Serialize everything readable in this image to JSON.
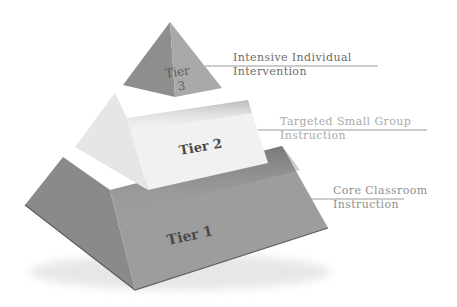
{
  "diagram": {
    "type": "pyramid",
    "tiers": [
      {
        "id": "tier-3",
        "shape_label_line1": "Tier",
        "shape_label_line2": "3",
        "description_line1": "Intensive Individual",
        "description_line2": "Intervention",
        "text_color": "#6b6b6b",
        "rule_color": "#9a9a9a"
      },
      {
        "id": "tier-2",
        "shape_label": "Tier 2",
        "description_line1": "Targeted Small Group",
        "description_line2": "Instruction",
        "text_color": "#aaaaaa",
        "rule_color": "#9a9a9a"
      },
      {
        "id": "tier-1",
        "shape_label": "Tier 1",
        "description_line1": "Core Classroom",
        "description_line2": "Instruction",
        "text_color": "#8f8f8f",
        "rule_color": "#9a9a9a"
      }
    ],
    "colors": {
      "tier3_left_face": "#8e8e8e",
      "tier3_right_face": "#a9a9a9",
      "tier2_left_face": "#e6e6e6",
      "tier2_front_face": "#f1f1f1",
      "tier1_left_face": "#8a8a8a",
      "tier1_front_face": "#9d9d9d",
      "shadow": "#5a5a5a"
    }
  }
}
